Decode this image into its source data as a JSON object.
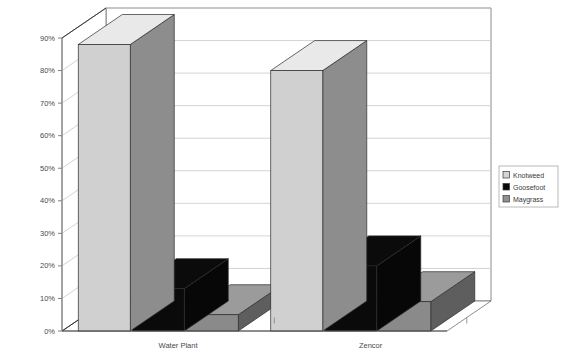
{
  "chart_data": {
    "type": "bar",
    "title": "",
    "subtitle": "",
    "xlabel": "",
    "ylabel": "",
    "categories": [
      "Water Plant",
      "Zencor"
    ],
    "series": [
      {
        "name": "Knotweed",
        "values": [
          88,
          80
        ],
        "color": "#d0d0d0"
      },
      {
        "name": "Goosefoot",
        "values": [
          13,
          20
        ],
        "color": "#0a0a0a"
      },
      {
        "name": "Maygrass",
        "values": [
          5,
          9
        ],
        "color": "#8a8a8a"
      }
    ],
    "ylim": [
      0,
      95
    ],
    "ytick_values": [
      0,
      10,
      20,
      30,
      40,
      50,
      60,
      70,
      80,
      90
    ],
    "ytick_labels": [
      "0%",
      "10%",
      "20%",
      "30%",
      "40%",
      "50%",
      "60%",
      "70%",
      "80%",
      "90%"
    ],
    "grid": true,
    "legend_position": "right",
    "projection": "3d",
    "axis_line_color": "#808080",
    "grid_color": "#c8c8c8",
    "frame_color": "#6e6e6e",
    "background": "#ffffff"
  },
  "legend": {
    "items": [
      {
        "label": "Knotweed",
        "swatch": "#d4d4d4",
        "swatch_type": "light"
      },
      {
        "label": "Goosefoot",
        "swatch": "#0a0a0a",
        "swatch_type": "solid-dark"
      },
      {
        "label": "Maygrass",
        "swatch": "#909090",
        "swatch_type": "medium"
      }
    ]
  },
  "axes": {
    "y_ticks": [
      "90%",
      "80%",
      "70%",
      "60%",
      "50%",
      "40%",
      "30%",
      "20%",
      "10%",
      "0%"
    ],
    "x_categories": [
      "Water Plant",
      "Zencor"
    ]
  }
}
